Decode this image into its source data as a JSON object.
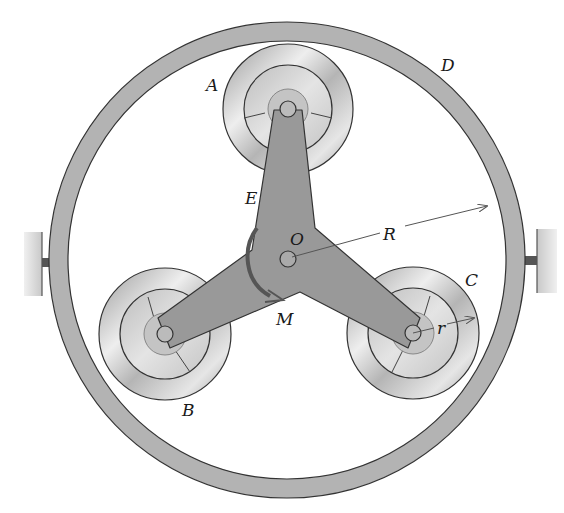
{
  "diagram": {
    "labels": {
      "A": "A",
      "B": "B",
      "C": "C",
      "D": "D",
      "E": "E",
      "O": "O",
      "R": "R",
      "r": "r",
      "M": "M"
    },
    "components": [
      {
        "id": "ring",
        "label": "D",
        "description": "outer fixed ring"
      },
      {
        "id": "spider",
        "label": "E",
        "description": "three-armed spider pivoted at O"
      },
      {
        "id": "roller-a",
        "label": "A",
        "description": "top roller"
      },
      {
        "id": "roller-b",
        "label": "B",
        "description": "lower-left roller"
      },
      {
        "id": "roller-c",
        "label": "C",
        "description": "lower-right roller"
      },
      {
        "id": "moment",
        "label": "M",
        "description": "applied couple on spider, clockwise arrow"
      }
    ],
    "dimensions": [
      {
        "symbol": "R",
        "description": "ring inner radius from O"
      },
      {
        "symbol": "r",
        "description": "roller radius"
      }
    ],
    "colors": {
      "ring_fill": "#b3b3b3",
      "spider_fill": "#999999",
      "roller_fill": "#c8c8c8",
      "outline": "#333333",
      "support_fill": "#d8d8d8",
      "support_pin": "#555555",
      "moment_arrow": "#555555"
    }
  }
}
